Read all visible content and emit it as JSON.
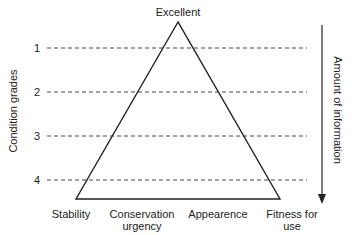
{
  "diagram": {
    "apex_label": "Excellent",
    "left_axis_label": "Condition grades",
    "right_axis_label": "Amount of information",
    "grades": [
      "1",
      "2",
      "3",
      "4"
    ],
    "base_labels": [
      {
        "line1": "Stability",
        "line2": ""
      },
      {
        "line1": "Conservation",
        "line2": "urgency"
      },
      {
        "line1": "Appearence",
        "line2": ""
      },
      {
        "line1": "Fitness for",
        "line2": "use"
      }
    ],
    "colors": {
      "stroke": "#222222",
      "dash": "#444444",
      "background": "#ffffff"
    }
  }
}
